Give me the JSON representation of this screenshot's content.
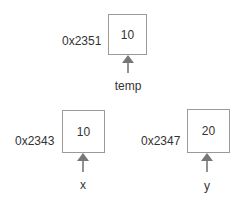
{
  "diagram": {
    "title": "",
    "colors": {
      "box_border": "#9a9a9a",
      "arrow": "#777777",
      "text": "#333333"
    },
    "cells": [
      {
        "id": "temp",
        "address": "0x2351",
        "value": "10",
        "variable": "temp"
      },
      {
        "id": "x",
        "address": "0x2343",
        "value": "10",
        "variable": "x"
      },
      {
        "id": "y",
        "address": "0x2347",
        "value": "20",
        "variable": "y"
      }
    ]
  }
}
